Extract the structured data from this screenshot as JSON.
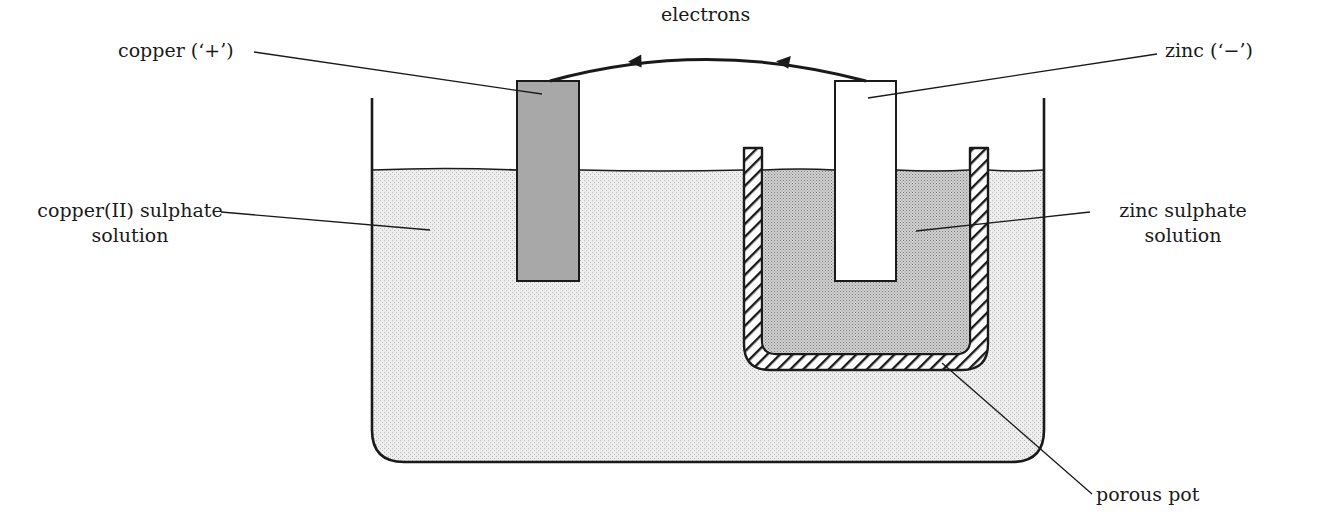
{
  "diagram": {
    "colors": {
      "ink": "#1a1a1a",
      "copper_electrode": "#a8a8a8",
      "copper_sulphate_solution": "#e6e6e6",
      "zinc_sulphate_solution": "#c4c4c4",
      "zinc_electrode": "#ffffff",
      "background": "#ffffff"
    },
    "labels": {
      "electrons": "electrons",
      "copper": "copper (‘+’)",
      "zinc": "zinc (‘−’)",
      "copper_sulphate_line1": "copper(II) sulphate",
      "copper_sulphate_line2": "solution",
      "zinc_sulphate_line1": "zinc sulphate",
      "zinc_sulphate_line2": "solution",
      "porous_pot": "porous pot"
    },
    "components": [
      {
        "id": "beaker",
        "name": "beaker"
      },
      {
        "id": "copper_electrode",
        "name": "copper electrode",
        "polarity": "+"
      },
      {
        "id": "zinc_electrode",
        "name": "zinc electrode",
        "polarity": "−"
      },
      {
        "id": "porous_pot",
        "name": "porous pot"
      },
      {
        "id": "external_wire",
        "name": "wire",
        "electron_flow": "zinc → copper"
      }
    ]
  }
}
